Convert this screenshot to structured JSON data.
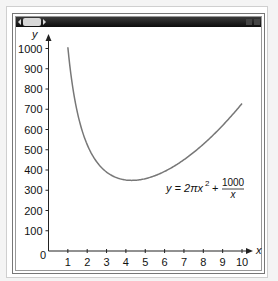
{
  "window": {
    "controls": [
      "scroll-left",
      "scroll-thumb",
      "scroll-right",
      "minimize",
      "close"
    ]
  },
  "chart_data": {
    "type": "line",
    "title": "",
    "xlabel": "x",
    "ylabel": "y",
    "xlim": [
      0,
      10
    ],
    "ylim": [
      0,
      1000
    ],
    "x_ticks": [
      "1",
      "2",
      "3",
      "4",
      "5",
      "6",
      "7",
      "8",
      "9",
      "10"
    ],
    "y_ticks": [
      "100",
      "200",
      "300",
      "400",
      "500",
      "600",
      "700",
      "800",
      "900",
      "1000"
    ],
    "origin_label": "0",
    "grid": false,
    "annotation": {
      "lhs": "y = 2πx",
      "exponent": "2",
      "plus": "+",
      "numerator": "1000",
      "denominator": "x"
    },
    "series": [
      {
        "name": "y = 2πx^2 + 1000/x",
        "color": "#777777",
        "x": [
          1,
          1.5,
          2,
          2.5,
          3,
          3.5,
          4,
          4.3,
          4.5,
          5,
          5.5,
          6,
          6.5,
          7,
          7.5,
          8,
          8.5,
          9,
          9.5,
          10
        ],
        "y": [
          1006,
          681,
          525,
          439,
          390,
          363,
          351,
          349,
          349,
          357,
          372,
          393,
          419,
          451,
          487,
          527,
          572,
          620,
          672,
          728
        ]
      }
    ]
  }
}
